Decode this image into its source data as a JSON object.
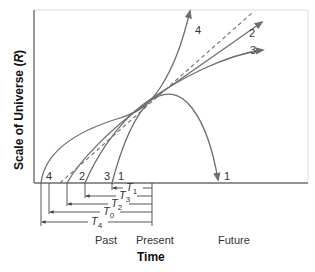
{
  "diagram": {
    "y_axis_label": "Scale of Universe (",
    "y_axis_symbol": "R",
    "y_axis_label_end": ")",
    "x_axis_label": "Time",
    "time_labels": {
      "past": "Past",
      "present": "Present",
      "future": "Future"
    },
    "curves": [
      {
        "id": "1",
        "label": "1",
        "end_label": "1",
        "description": "recollapsing universe"
      },
      {
        "id": "2",
        "label": "2"
      },
      {
        "id": "3",
        "label": "3"
      },
      {
        "id": "4",
        "label": "4"
      },
      {
        "id": "0",
        "label": "0",
        "style": "dashed"
      }
    ],
    "age_intervals": [
      {
        "symbol": "T",
        "subscript": "1"
      },
      {
        "symbol": "T",
        "subscript": "3"
      },
      {
        "symbol": "T",
        "subscript": "2"
      },
      {
        "symbol": "T",
        "subscript": "0"
      },
      {
        "symbol": "T",
        "subscript": "4"
      }
    ],
    "colors": {
      "curve": "#6e6e6e",
      "axis": "#6e6e6e",
      "frame": "#dddddd",
      "text": "#333333"
    }
  }
}
